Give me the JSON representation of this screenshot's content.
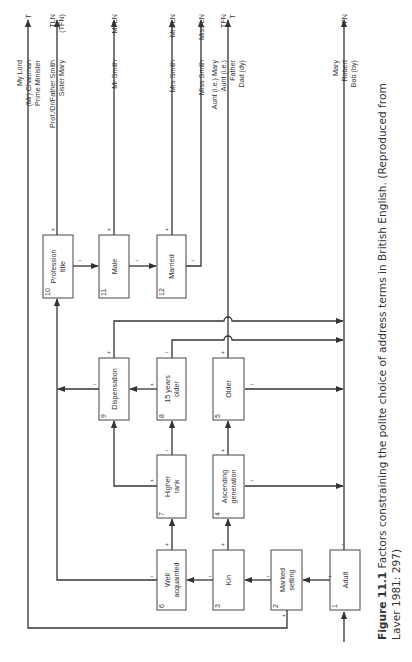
{
  "figure": {
    "caption_label": "Figure 11.1",
    "caption_line1": " Factors constraining the polite choice of address terms in British English. (Reproduced from",
    "caption_line2": "Laver 1981: 297)"
  },
  "boxes": [
    {
      "id": 1,
      "num": "1",
      "lines": [
        "Adult"
      ],
      "x": 330,
      "y": 550,
      "w": 30,
      "h": 60
    },
    {
      "id": 2,
      "num": "2",
      "lines": [
        "Marked",
        "setting"
      ],
      "x": 271,
      "y": 550,
      "w": 31,
      "h": 60
    },
    {
      "id": 3,
      "num": "3",
      "lines": [
        "Kin"
      ],
      "x": 213,
      "y": 550,
      "w": 31,
      "h": 60
    },
    {
      "id": 4,
      "num": "4",
      "lines": [
        "Ascending",
        "generation"
      ],
      "x": 213,
      "y": 455,
      "w": 31,
      "h": 63
    },
    {
      "id": 5,
      "num": "5",
      "lines": [
        "Older"
      ],
      "x": 213,
      "y": 358,
      "w": 31,
      "h": 62
    },
    {
      "id": 6,
      "num": "6",
      "lines": [
        "Well",
        "acquainted"
      ],
      "x": 157,
      "y": 550,
      "w": 29,
      "h": 60
    },
    {
      "id": 7,
      "num": "7",
      "lines": [
        "Higher",
        "rank"
      ],
      "x": 157,
      "y": 455,
      "w": 29,
      "h": 63
    },
    {
      "id": 8,
      "num": "8",
      "lines": [
        "15 years",
        "older"
      ],
      "x": 157,
      "y": 358,
      "w": 29,
      "h": 62
    },
    {
      "id": 9,
      "num": "9",
      "lines": [
        "Dispensation"
      ],
      "x": 99,
      "y": 358,
      "w": 30,
      "h": 62
    },
    {
      "id": 10,
      "num": "10",
      "lines": [
        "Profession",
        "title"
      ],
      "x": 43,
      "y": 235,
      "w": 30,
      "h": 63
    },
    {
      "id": 11,
      "num": "11",
      "lines": [
        "Male"
      ],
      "x": 99,
      "y": 235,
      "w": 30,
      "h": 63
    },
    {
      "id": 12,
      "num": "12",
      "lines": [
        "Married"
      ],
      "x": 157,
      "y": 235,
      "w": 29,
      "h": 63
    }
  ],
  "outputs": [
    {
      "x": 28,
      "code": [
        "T"
      ],
      "examples": [
        "My Lord",
        "(Mr) Chairman",
        "Prime Minister"
      ]
    },
    {
      "x": 57,
      "code": [
        "TLN",
        "(TFN)"
      ],
      "examples": [
        "Prof./Dr/Father Smith",
        "Sister Mary"
      ]
    },
    {
      "x": 114,
      "code": [
        "Mr LN"
      ],
      "examples": [
        "Mr Smith"
      ]
    },
    {
      "x": 172,
      "code": [
        "Mrs LN"
      ],
      "examples": [
        "Mrs Smith"
      ]
    },
    {
      "x": 201,
      "code": [
        "Miss LN"
      ],
      "examples": [
        "Miss Smith"
      ]
    },
    {
      "x": 228,
      "code": [
        "TFN",
        "T"
      ],
      "examples": [
        "Aunt (i.e.) Mary",
        "Aunt (i.e.)",
        "Father",
        "Dad (dy)"
      ]
    },
    {
      "x": 344,
      "code": [
        "FN"
      ],
      "examples": [
        "Mary",
        "Robert",
        "Bob (by)"
      ]
    }
  ],
  "signs": [
    {
      "x": 330,
      "y": 578,
      "s": "+"
    },
    {
      "x": 343,
      "y": 546,
      "s": "−"
    },
    {
      "x": 268,
      "y": 578,
      "s": "−"
    },
    {
      "x": 284,
      "y": 617,
      "s": "+"
    },
    {
      "x": 210,
      "y": 578,
      "s": "−"
    },
    {
      "x": 223,
      "y": 546,
      "s": "+"
    },
    {
      "x": 152,
      "y": 578,
      "s": "−"
    },
    {
      "x": 167,
      "y": 546,
      "s": "+"
    },
    {
      "x": 152,
      "y": 482,
      "s": "+"
    },
    {
      "x": 167,
      "y": 452,
      "s": "−"
    },
    {
      "x": 252,
      "y": 482,
      "s": "−"
    },
    {
      "x": 223,
      "y": 452,
      "s": "+"
    },
    {
      "x": 252,
      "y": 386,
      "s": "−"
    },
    {
      "x": 223,
      "y": 354,
      "s": "+"
    },
    {
      "x": 152,
      "y": 386,
      "s": "+"
    },
    {
      "x": 167,
      "y": 354,
      "s": "−"
    },
    {
      "x": 95,
      "y": 386,
      "s": "−"
    },
    {
      "x": 109,
      "y": 354,
      "s": "+"
    },
    {
      "x": 80,
      "y": 262,
      "s": "−"
    },
    {
      "x": 53,
      "y": 231,
      "s": "+"
    },
    {
      "x": 137,
      "y": 262,
      "s": "−"
    },
    {
      "x": 109,
      "y": 231,
      "s": "+"
    },
    {
      "x": 193,
      "y": 262,
      "s": "−"
    },
    {
      "x": 167,
      "y": 231,
      "s": "+"
    }
  ]
}
